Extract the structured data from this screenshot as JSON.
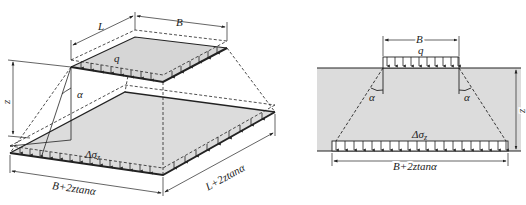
{
  "left_figure": {
    "dim_L": "L",
    "dim_B": "B",
    "load_q": "q",
    "depth_z": "z",
    "angle": "α",
    "stress": "Δσ",
    "stress_sub": "z",
    "bottom_width": "B+2ztanα",
    "bottom_length": "L+2ztanα"
  },
  "right_figure": {
    "dim_B": "B",
    "load_q": "q",
    "angle_left": "α",
    "angle_right": "α",
    "depth_z": "z",
    "stress": "Δσ",
    "stress_sub": "z",
    "bottom_width": "B+2ztanα"
  },
  "colors": {
    "soil_fill": "#dcdcdc",
    "plate_fill": "#d6d6d6",
    "line": "#222222"
  }
}
